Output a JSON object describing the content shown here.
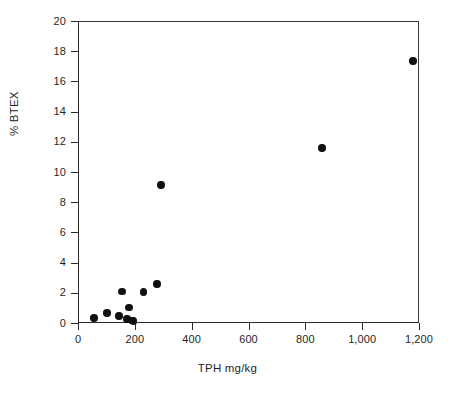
{
  "chart_data": {
    "type": "scatter",
    "title": "",
    "xlabel": "TPH mg/kg",
    "ylabel": "% BTEX",
    "xlim": [
      0,
      1200
    ],
    "ylim": [
      0,
      20
    ],
    "xticks": [
      0,
      200,
      400,
      600,
      800,
      1000,
      1200
    ],
    "xtick_labels": [
      "0",
      "200",
      "400",
      "600",
      "800",
      "1,000",
      "1,200"
    ],
    "yticks": [
      0,
      2,
      4,
      6,
      8,
      10,
      12,
      14,
      16,
      18,
      20
    ],
    "ytick_labels": [
      "0",
      "2",
      "4",
      "6",
      "8",
      "10",
      "12",
      "14",
      "16",
      "18",
      "20"
    ],
    "grid": false,
    "legend": null,
    "marker_color": "#111111",
    "marker_shape": "circle",
    "points": [
      {
        "x": 56,
        "y": 0.33
      },
      {
        "x": 102,
        "y": 0.66
      },
      {
        "x": 144,
        "y": 0.46
      },
      {
        "x": 155,
        "y": 2.07
      },
      {
        "x": 172,
        "y": 0.26
      },
      {
        "x": 180,
        "y": 1.03
      },
      {
        "x": 190,
        "y": 0.18
      },
      {
        "x": 196,
        "y": 0.14
      },
      {
        "x": 231,
        "y": 2.05
      },
      {
        "x": 278,
        "y": 2.58
      },
      {
        "x": 292,
        "y": 9.15
      },
      {
        "x": 859,
        "y": 11.6
      },
      {
        "x": 1179,
        "y": 17.35
      }
    ]
  }
}
